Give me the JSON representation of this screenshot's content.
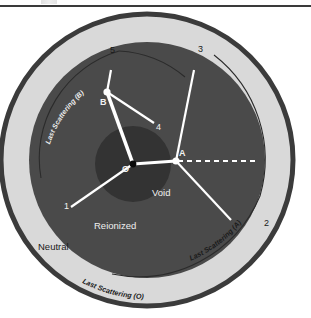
{
  "figure": {
    "title_bar": {
      "rule_visible": true,
      "smudge_artifact": "illegible-clipped-text"
    },
    "colors": {
      "page_background": "#ffffff",
      "outer_stroke": "#3b3b3b",
      "neutral_fill": "#d9d9d9",
      "reionized_fill": "#4a4a4a",
      "void_fill": "#333333",
      "ray_color": "#ffffff",
      "arc_thin_stroke": "#2e2e2e",
      "dark_text": "#111111",
      "light_text": "#f2f2f2"
    },
    "geometry": {
      "center_x": 147,
      "center_y": 152,
      "outer_radius": 147,
      "neutral_inner_radius": 118,
      "reionized_radius": 118,
      "void_radius": 38,
      "void_center_x": 133,
      "void_center_y": 156
    },
    "points": [
      {
        "id": "O",
        "label": "O",
        "x": 133,
        "y": 156,
        "marker": "black-dot"
      },
      {
        "id": "A",
        "label": "A",
        "x": 176,
        "y": 153,
        "marker": "white-dot"
      },
      {
        "id": "B",
        "label": "B",
        "x": 107,
        "y": 84,
        "marker": "white-dot"
      }
    ],
    "rays": [
      {
        "label": "1",
        "from": "O",
        "to_x": 71,
        "to_y": 199
      },
      {
        "label": "2",
        "from": "A",
        "to_x": 231,
        "to_y": 212
      },
      {
        "label": "3",
        "from": "A",
        "to_x": 194,
        "to_y": 62
      },
      {
        "label": "4",
        "from": "B",
        "to_x": 154,
        "to_y": 115
      },
      {
        "label": "5",
        "from": "B",
        "to_x": 111,
        "to_y": 62
      }
    ],
    "segments": [
      {
        "name": "O-to-A",
        "kind": "solid-white"
      },
      {
        "name": "O-to-B",
        "kind": "solid-white-thick"
      },
      {
        "name": "A-horizontal-dashed",
        "kind": "dashed-white"
      }
    ],
    "zone_labels": [
      {
        "id": "neutral",
        "text": "Neutral",
        "x": 38,
        "y": 238
      },
      {
        "id": "reionized",
        "text": "Reionized",
        "x": 94,
        "y": 218
      },
      {
        "id": "void",
        "text": "Void",
        "x": 154,
        "y": 185
      }
    ],
    "arc_labels": [
      {
        "id": "last-scattering-O",
        "text": "Last Scattering (O)"
      },
      {
        "id": "last-scattering-A",
        "text": "Last Scattering (A)"
      },
      {
        "id": "last-scattering-B",
        "text": "Last Scattering (B)"
      }
    ],
    "arcs": [
      {
        "id": "ls-A-arc",
        "about_point": "A",
        "style": "thin-dark"
      },
      {
        "id": "ls-B-arc",
        "about_point": "B",
        "style": "thin-dark"
      },
      {
        "id": "ls-O-arc",
        "about_point": "O",
        "style": "outer-boundary"
      }
    ]
  }
}
